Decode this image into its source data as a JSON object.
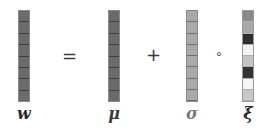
{
  "equation": {
    "operators": {
      "equals": "=",
      "plus": "+",
      "hadamard": "∘"
    },
    "columns": [
      {
        "id": "w",
        "label": "w",
        "cells": [
          "#6b6b6b",
          "#6b6b6b",
          "#6b6b6b",
          "#6b6b6b",
          "#6b6b6b",
          "#6b6b6b",
          "#6b6b6b",
          "#6b6b6b"
        ]
      },
      {
        "id": "mu",
        "label": "μ",
        "cells": [
          "#6a6a6a",
          "#6a6a6a",
          "#6a6a6a",
          "#6a6a6a",
          "#6a6a6a",
          "#6a6a6a",
          "#6a6a6a",
          "#6a6a6a"
        ]
      },
      {
        "id": "sigma",
        "label": "σ",
        "cells": [
          "#a9a9a9",
          "#a9a9a9",
          "#a9a9a9",
          "#a9a9a9",
          "#a9a9a9",
          "#a9a9a9",
          "#a9a9a9",
          "#a9a9a9"
        ]
      },
      {
        "id": "xi",
        "label": "ξ",
        "cells": [
          "#8a8a8a",
          "#a8a8a8",
          "#2e2e2e",
          "#f2f2f2",
          "#c4c4c4",
          "#333333",
          "#f4f4f4",
          "#c8c8c8"
        ]
      }
    ]
  }
}
